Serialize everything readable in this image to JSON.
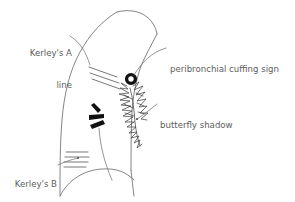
{
  "figure": {
    "colors": {
      "background": "#ffffff",
      "text": "#5d5d5d",
      "outline": "#6e6e6e",
      "leader": "#7a7a7a",
      "mark_black": "#111111",
      "kerley_line": "#555555",
      "butterfly": "#444444"
    },
    "annotations": [
      {
        "id": "kerleys-a",
        "label_line1": "Kerley's A",
        "label_line2": "line",
        "label_full": "Kerley's A line",
        "align": "right"
      },
      {
        "id": "peribronchial-cuffing",
        "label_line1": "peribronchial cuffing sign",
        "label_line2": "",
        "label_full": "peribronchial cuffing sign",
        "align": "left"
      },
      {
        "id": "butterfly-shadow",
        "label_line1": "butterfly shadow",
        "label_line2": "",
        "label_full": "butterfly shadow",
        "align": "left"
      },
      {
        "id": "kerleys-b",
        "label_line1": "Kerley's B",
        "label_line2": "line",
        "label_full": "Kerley's B line",
        "align": "right"
      },
      {
        "id": "air-bronchogram",
        "label_line1": "air bronchogram",
        "label_line2": "",
        "label_full": "air bronchogram",
        "align": "left"
      }
    ]
  }
}
